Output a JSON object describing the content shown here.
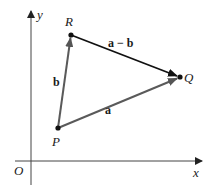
{
  "diagram": {
    "type": "vector-triangle",
    "axes": {
      "origin_label": "O",
      "x_label": "x",
      "y_label": "y"
    },
    "points": [
      {
        "id": "P",
        "label": "P",
        "x": 58,
        "y": 128
      },
      {
        "id": "Q",
        "label": "Q",
        "x": 180,
        "y": 77
      },
      {
        "id": "R",
        "label": "R",
        "x": 71,
        "y": 35
      }
    ],
    "vectors": [
      {
        "id": "a",
        "label": "a",
        "from": "P",
        "to": "Q",
        "color": "#5a5a5a"
      },
      {
        "id": "b",
        "label": "b",
        "from": "P",
        "to": "R",
        "color": "#5a5a5a"
      },
      {
        "id": "a-minus-b",
        "label": "a − b",
        "from": "R",
        "to": "Q",
        "color": "#111111"
      }
    ],
    "colors": {
      "axis": "#333333",
      "gray_vector": "#5a5a5a",
      "black_vector": "#111111",
      "point": "#111111"
    }
  }
}
